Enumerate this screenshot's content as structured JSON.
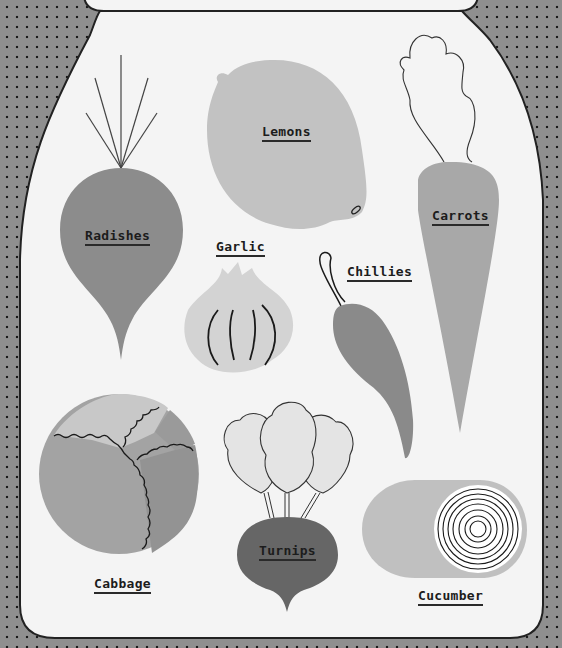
{
  "poster": {
    "lid_title": "",
    "colors": {
      "background": "#8f8f8f",
      "dots": "#1a1a1a",
      "jar_fill": "#f4f4f4",
      "jar_outline": "#222222"
    }
  },
  "vegetables": [
    {
      "name": "radishes",
      "label": "Radishes",
      "fill": "#8c8c8c"
    },
    {
      "name": "lemons",
      "label": "Lemons",
      "fill": "#c2c2c2"
    },
    {
      "name": "carrots",
      "label": "Carrots",
      "fill": "#a8a8a8"
    },
    {
      "name": "garlic",
      "label": "Garlic",
      "fill": "#d3d3d3"
    },
    {
      "name": "chillies",
      "label": "Chillies",
      "fill": "#8a8a8a"
    },
    {
      "name": "cabbage",
      "label": "Cabbage",
      "fill": "#a3a3a3"
    },
    {
      "name": "turnips",
      "label": "Turnips",
      "fill": "#666666"
    },
    {
      "name": "cucumber",
      "label": "Cucumber",
      "fill": "#c0c0c0"
    }
  ]
}
